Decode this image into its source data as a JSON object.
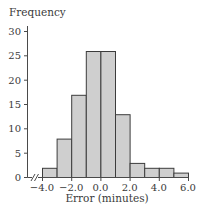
{
  "chart_data": {
    "type": "bar",
    "subtype": "histogram",
    "title": "",
    "xlabel": "Error (minutes)",
    "ylabel": "Frequency",
    "bin_edges": [
      -4.0,
      -3.0,
      -2.0,
      -1.0,
      0.0,
      1.0,
      2.0,
      3.0,
      4.0,
      5.0,
      6.0
    ],
    "categories": [
      "-4.0 to -3.0",
      "-3.0 to -2.0",
      "-2.0 to -1.0",
      "-1.0 to 0.0",
      "0.0 to 1.0",
      "1.0 to 2.0",
      "2.0 to 3.0",
      "3.0 to 4.0",
      "4.0 to 5.0",
      "5.0 to 6.0"
    ],
    "values": [
      2,
      8,
      17,
      26,
      26,
      13,
      3,
      2,
      2,
      1
    ],
    "xlim": [
      -4.0,
      6.0
    ],
    "ylim": [
      0,
      30
    ],
    "x_ticks": [
      "-4.0",
      "-2.0",
      "0.0",
      "2.0",
      "4.0",
      "6.0"
    ],
    "y_ticks": [
      "0",
      "5",
      "10",
      "15",
      "20",
      "25",
      "30"
    ],
    "axis_break": "x-axis break mark (//) near origin",
    "grid": false,
    "legend": null,
    "bar_fill": "#cfcfcf",
    "bar_edge": "#3c3c3c"
  }
}
